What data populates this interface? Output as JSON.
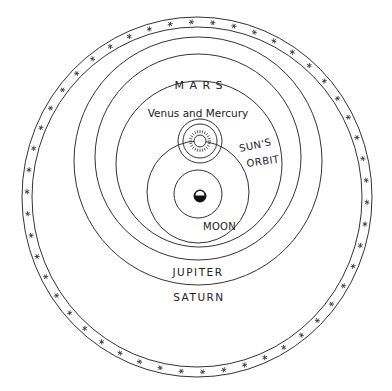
{
  "diagram": {
    "labels": {
      "mars": "M A R S",
      "venus_mercury": "Venus and Mercury",
      "suns": "SUN'S",
      "orbit": "ORBIT",
      "moon": "MOON",
      "jupiter": "JUPITER",
      "saturn": "SATURN"
    },
    "star_sphere": {
      "star_count": 50,
      "center": [
        197,
        197
      ],
      "outer_radius": [
        175,
        180
      ],
      "inner_radius": [
        165,
        170
      ]
    },
    "orbits": [
      {
        "name": "saturn-orbit",
        "cx": 198,
        "cy": 161,
        "r": 124
      },
      {
        "name": "jupiter-orbit",
        "cx": 198,
        "cy": 157,
        "r": 103
      },
      {
        "name": "mars-orbit",
        "cx": 199,
        "cy": 164,
        "r": 83
      },
      {
        "name": "sun-orbit",
        "cx": 198,
        "cy": 192,
        "r": 51
      },
      {
        "name": "moon-orbit",
        "cx": 198,
        "cy": 194,
        "r": 24
      },
      {
        "name": "venus-orbit",
        "cx": 200,
        "cy": 141,
        "r": 22
      },
      {
        "name": "mercury-orbit",
        "cx": 200,
        "cy": 141,
        "r": 17
      }
    ],
    "bodies": {
      "sun": {
        "cx": 200,
        "cy": 141,
        "r": 6
      },
      "earth": {
        "cx": 200,
        "cy": 196,
        "r": 6
      },
      "moon": {
        "cx": 199,
        "cy": 216
      }
    },
    "colors": {
      "line": "#333333",
      "background": "#ffffff"
    }
  }
}
